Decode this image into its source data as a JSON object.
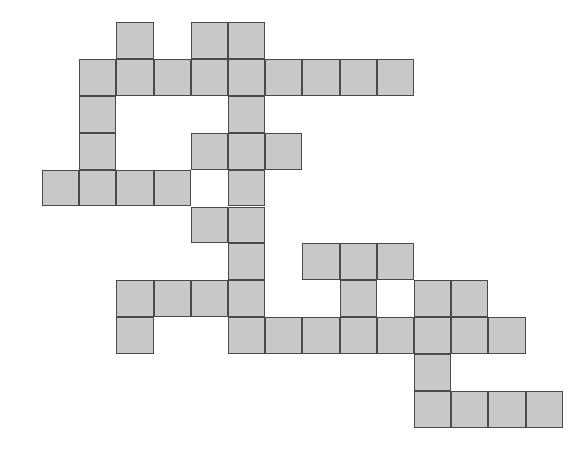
{
  "figure": {
    "kind": "grid-polyomino",
    "canvas": {
      "width": 587,
      "height": 451,
      "background_color": "#ffffff"
    },
    "cell_style": {
      "fill_color": "#c8c8c8",
      "stroke_color": "#4a4a4a",
      "stroke_width": 1.6,
      "cell_width": 37.2,
      "cell_height": 36.9
    },
    "grid": {
      "origin_x": 42,
      "origin_y": 22,
      "columns": 14,
      "rows": 11,
      "total_filled_cells": 60
    },
    "cells": [
      {
        "col": 2,
        "row": 0
      },
      {
        "col": 4,
        "row": 0
      },
      {
        "col": 5,
        "row": 0
      },
      {
        "col": 1,
        "row": 1
      },
      {
        "col": 2,
        "row": 1
      },
      {
        "col": 3,
        "row": 1
      },
      {
        "col": 4,
        "row": 1
      },
      {
        "col": 5,
        "row": 1
      },
      {
        "col": 6,
        "row": 1
      },
      {
        "col": 7,
        "row": 1
      },
      {
        "col": 8,
        "row": 1
      },
      {
        "col": 9,
        "row": 1
      },
      {
        "col": 1,
        "row": 2
      },
      {
        "col": 5,
        "row": 2
      },
      {
        "col": 1,
        "row": 3
      },
      {
        "col": 4,
        "row": 3
      },
      {
        "col": 5,
        "row": 3
      },
      {
        "col": 6,
        "row": 3
      },
      {
        "col": 0,
        "row": 4
      },
      {
        "col": 1,
        "row": 4
      },
      {
        "col": 2,
        "row": 4
      },
      {
        "col": 3,
        "row": 4
      },
      {
        "col": 5,
        "row": 4
      },
      {
        "col": 4,
        "row": 5
      },
      {
        "col": 5,
        "row": 5
      },
      {
        "col": 5,
        "row": 6
      },
      {
        "col": 7,
        "row": 6
      },
      {
        "col": 8,
        "row": 6
      },
      {
        "col": 9,
        "row": 6
      },
      {
        "col": 2,
        "row": 7
      },
      {
        "col": 3,
        "row": 7
      },
      {
        "col": 4,
        "row": 7
      },
      {
        "col": 5,
        "row": 7
      },
      {
        "col": 8,
        "row": 7
      },
      {
        "col": 10,
        "row": 7
      },
      {
        "col": 11,
        "row": 7
      },
      {
        "col": 2,
        "row": 8
      },
      {
        "col": 5,
        "row": 8
      },
      {
        "col": 6,
        "row": 8
      },
      {
        "col": 7,
        "row": 8
      },
      {
        "col": 8,
        "row": 8
      },
      {
        "col": 9,
        "row": 8
      },
      {
        "col": 10,
        "row": 8
      },
      {
        "col": 11,
        "row": 8
      },
      {
        "col": 12,
        "row": 8
      },
      {
        "col": 10,
        "row": 9
      },
      {
        "col": 10,
        "row": 10
      },
      {
        "col": 11,
        "row": 10
      },
      {
        "col": 12,
        "row": 10
      },
      {
        "col": 13,
        "row": 10
      }
    ]
  }
}
